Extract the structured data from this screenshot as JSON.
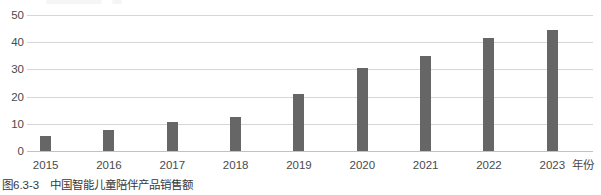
{
  "chart_data": {
    "type": "bar",
    "title": "",
    "categories": [
      "2015",
      "2016",
      "2017",
      "2018",
      "2019",
      "2020",
      "2021",
      "2022",
      "2023"
    ],
    "values": [
      5.6,
      7.8,
      10.5,
      12.5,
      21,
      30.5,
      35,
      41.5,
      44.5
    ],
    "y_ticks": [
      0,
      10,
      20,
      30,
      40,
      50
    ],
    "ylim": [
      0,
      50
    ],
    "xlabel": "年份",
    "ylabel": "",
    "grid": true,
    "legend_position": "none",
    "bar_color": "#666666",
    "gridline_color": "#d6d6d6",
    "axis_line_color": "#c2c2c2",
    "tick_label_color": "#4a4a4a"
  },
  "caption": {
    "label": "图6.3-3",
    "title": "中国智能儿童陪伴产品销售额"
  }
}
